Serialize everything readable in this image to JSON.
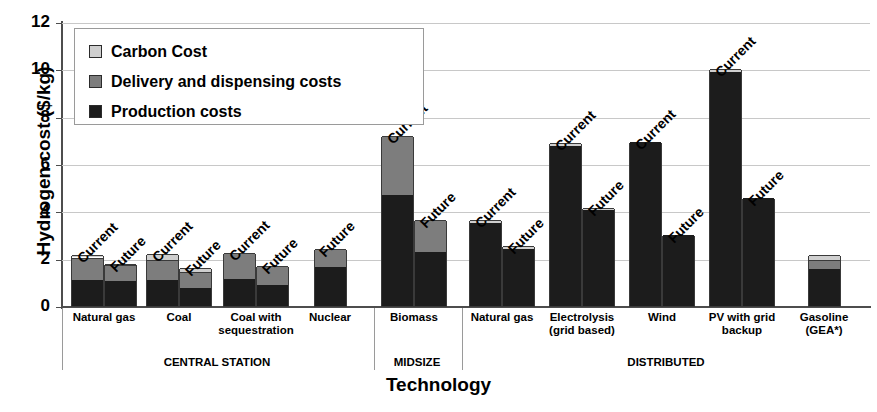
{
  "chart_data": {
    "type": "bar",
    "subtype": "stacked",
    "title": "",
    "xlabel": "Technology",
    "ylabel": "Hydrogen cost ($/kg)",
    "ylim": [
      0,
      12
    ],
    "yticks": [
      0,
      2,
      4,
      6,
      8,
      10,
      12
    ],
    "grid": true,
    "legend_position": "top-left",
    "series": [
      {
        "name": "Carbon Cost",
        "color": "#cfcfcf"
      },
      {
        "name": "Delivery and dispensing costs",
        "color": "#7d7d7d"
      },
      {
        "name": "Production costs",
        "color": "#1c1c1c"
      }
    ],
    "groups": [
      {
        "label": "CENTRAL STATION",
        "categories": [
          {
            "name": "Natural gas",
            "lines": [
              "Natural gas"
            ],
            "bars": [
              {
                "scenario": "Current",
                "production": 1.1,
                "delivery": 0.95,
                "carbon": 0.1,
                "total": 2.15
              },
              {
                "scenario": "Future",
                "production": 1.05,
                "delivery": 0.68,
                "carbon": 0.05,
                "total": 1.78
              }
            ]
          },
          {
            "name": "Coal",
            "lines": [
              "Coal"
            ],
            "bars": [
              {
                "scenario": "Current",
                "production": 1.1,
                "delivery": 0.85,
                "carbon": 0.25,
                "total": 2.2
              },
              {
                "scenario": "Future",
                "production": 0.78,
                "delivery": 0.67,
                "carbon": 0.15,
                "total": 1.6
              }
            ]
          },
          {
            "name": "Coal with sequestration",
            "lines": [
              "Coal with",
              "sequestration"
            ],
            "bars": [
              {
                "scenario": "Current",
                "production": 1.15,
                "delivery": 1.07,
                "carbon": 0.0,
                "total": 2.22
              },
              {
                "scenario": "Future",
                "production": 0.88,
                "delivery": 0.82,
                "carbon": 0.0,
                "total": 1.7
              }
            ]
          },
          {
            "name": "Nuclear",
            "lines": [
              "Nuclear"
            ],
            "bars": [
              {
                "scenario": "Future",
                "production": 1.65,
                "delivery": 0.75,
                "carbon": 0.0,
                "total": 2.4
              }
            ]
          }
        ]
      },
      {
        "label": "MIDSIZE",
        "categories": [
          {
            "name": "Biomass",
            "lines": [
              "Biomass"
            ],
            "bars": [
              {
                "scenario": "Current",
                "production": 4.7,
                "delivery": 2.5,
                "carbon": 0.0,
                "total": 7.2
              },
              {
                "scenario": "Future",
                "production": 2.3,
                "delivery": 1.35,
                "carbon": 0.0,
                "total": 3.65
              }
            ]
          }
        ]
      },
      {
        "label": "DISTRIBUTED",
        "categories": [
          {
            "name": "Natural gas",
            "lines": [
              "Natural gas"
            ],
            "bars": [
              {
                "scenario": "Current",
                "production": 3.5,
                "delivery": 0.0,
                "carbon": 0.12,
                "total": 3.62
              },
              {
                "scenario": "Future",
                "production": 2.4,
                "delivery": 0.0,
                "carbon": 0.12,
                "total": 2.52
              }
            ]
          },
          {
            "name": "Electrolysis (grid based)",
            "lines": [
              "Electrolysis",
              "(grid based)"
            ],
            "bars": [
              {
                "scenario": "Current",
                "production": 6.78,
                "delivery": 0.0,
                "carbon": 0.12,
                "total": 6.9
              },
              {
                "scenario": "Future",
                "production": 4.05,
                "delivery": 0.0,
                "carbon": 0.1,
                "total": 4.15
              }
            ]
          },
          {
            "name": "Wind",
            "lines": [
              "Wind"
            ],
            "bars": [
              {
                "scenario": "Current",
                "production": 6.95,
                "delivery": 0.0,
                "carbon": 0.0,
                "total": 6.95
              },
              {
                "scenario": "Future",
                "production": 3.0,
                "delivery": 0.0,
                "carbon": 0.0,
                "total": 3.0
              }
            ]
          },
          {
            "name": "PV with grid backup",
            "lines": [
              "PV with grid",
              "backup"
            ],
            "bars": [
              {
                "scenario": "Current",
                "production": 9.88,
                "delivery": 0.0,
                "carbon": 0.12,
                "total": 10.0
              },
              {
                "scenario": "Future",
                "production": 4.58,
                "delivery": 0.0,
                "carbon": 0.0,
                "total": 4.58
              }
            ]
          },
          {
            "name": "Gasoline (GEA*)",
            "lines": [
              "Gasoline",
              "(GEA*)"
            ],
            "bars": [
              {
                "scenario": "",
                "production": 1.55,
                "delivery": 0.38,
                "carbon": 0.22,
                "total": 2.15
              }
            ]
          }
        ]
      }
    ]
  }
}
